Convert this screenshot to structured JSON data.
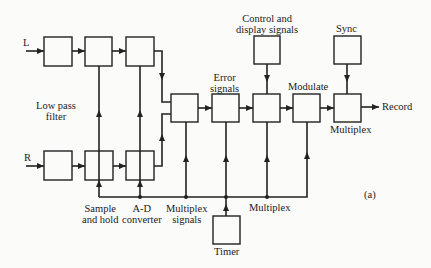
{
  "diagram": {
    "inputs": {
      "left": "L",
      "right": "R"
    },
    "labels": {
      "low_pass_filter": [
        "Low pass",
        "filter"
      ],
      "sample_and_hold": [
        "Sample",
        "and hold"
      ],
      "ad_converter": [
        "A-D",
        "converter"
      ],
      "multiplex_signals": [
        "Multiplex",
        "signals"
      ],
      "error_signals": [
        "Error",
        "signals"
      ],
      "control_display": [
        "Control and",
        "display signals"
      ],
      "modulate": "Modulate",
      "sync": "Sync",
      "multiplex_out": "Multiplex",
      "multiplex_bus": "Multiplex",
      "timer": "Timer",
      "output": "Record",
      "figure_tag": "(a)"
    },
    "blocks": [
      {
        "id": "lpf-l",
        "name": "Low pass filter (L)"
      },
      {
        "id": "sh-l",
        "name": "Sample and hold (L)"
      },
      {
        "id": "adc-l",
        "name": "A-D converter (L)"
      },
      {
        "id": "lpf-r",
        "name": "Low pass filter (R)"
      },
      {
        "id": "sh-r",
        "name": "Sample and hold (R)"
      },
      {
        "id": "adc-r",
        "name": "A-D converter (R)"
      },
      {
        "id": "mux-signals",
        "name": "Multiplex signals"
      },
      {
        "id": "error",
        "name": "Error signals"
      },
      {
        "id": "control-mux",
        "name": "Multiplex"
      },
      {
        "id": "control-display",
        "name": "Control and display signals"
      },
      {
        "id": "modulate",
        "name": "Modulate"
      },
      {
        "id": "sync",
        "name": "Sync"
      },
      {
        "id": "final-mux",
        "name": "Multiplex"
      },
      {
        "id": "timer",
        "name": "Timer"
      }
    ]
  }
}
